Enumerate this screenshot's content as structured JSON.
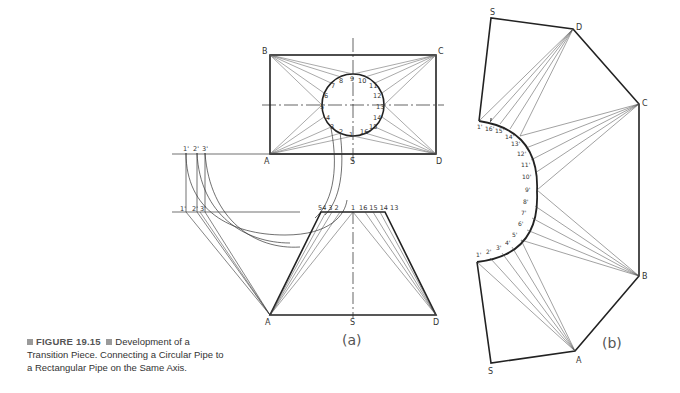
{
  "caption": {
    "figure_label": "FIGURE 19.15",
    "text": "Development of a Transition Piece. Connecting a Circular Pipe to a Rectangular Pipe on the Same Axis."
  },
  "view_a": {
    "label": "(a)",
    "plan_corners": {
      "top_left": "B",
      "top_right": "C",
      "bottom_left": "A",
      "bottom_right": "D",
      "bottom_mid": "S"
    },
    "circle_points": [
      "1",
      "2",
      "3",
      "4",
      "5",
      "6",
      "7",
      "8",
      "9",
      "10",
      "11",
      "12",
      "13",
      "14",
      "15",
      "16"
    ],
    "true_length_top": [
      "1'",
      "2'",
      "3'"
    ],
    "true_length_bottom": [
      "1'",
      "2'",
      "3'"
    ],
    "elevation_top_left": "54 3 2",
    "elevation_top_mid": "1",
    "elevation_top_right": "16 15 14 13",
    "elevation_corners": {
      "left": "A",
      "mid": "S",
      "right": "D"
    }
  },
  "view_b": {
    "label": "(b)",
    "vertices": {
      "top": "S",
      "d": "D",
      "c": "C",
      "b": "B",
      "a": "A",
      "bottom": "S"
    },
    "arc_points": [
      "1'",
      "16'",
      "15'",
      "14'",
      "13'",
      "12'",
      "11'",
      "10'",
      "9'",
      "8'",
      "7'",
      "6'",
      "5'",
      "4'",
      "3'",
      "2'",
      "1'"
    ]
  }
}
